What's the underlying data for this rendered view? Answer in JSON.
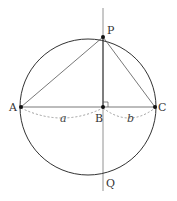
{
  "diagram": {
    "type": "geometry",
    "colors": {
      "stroke": "#333333",
      "thin_stroke": "#666666",
      "dashed": "#888888",
      "point": "#111111"
    },
    "points": {
      "A": {
        "label": "A",
        "x": 21,
        "y": 107
      },
      "B": {
        "label": "B",
        "x": 103,
        "y": 107
      },
      "C": {
        "label": "C",
        "x": 155,
        "y": 107
      },
      "P": {
        "label": "P",
        "x": 103,
        "y": 37
      },
      "Q": {
        "label": "Q",
        "x": 103,
        "y": 176
      }
    },
    "circle": {
      "cx": 88,
      "cy": 107,
      "r": 68
    },
    "segments": [
      {
        "from": "A",
        "to": "P"
      },
      {
        "from": "P",
        "to": "C"
      },
      {
        "from": "A",
        "to": "C"
      },
      {
        "from": "P",
        "to": "B"
      }
    ],
    "vertical_line": {
      "x": 103,
      "y1": 8,
      "y2": 191
    },
    "right_angle_marker": {
      "at": "B"
    },
    "lengths": [
      {
        "label": "a",
        "from": "A",
        "to": "B"
      },
      {
        "label": "b",
        "from": "B",
        "to": "C"
      }
    ]
  }
}
